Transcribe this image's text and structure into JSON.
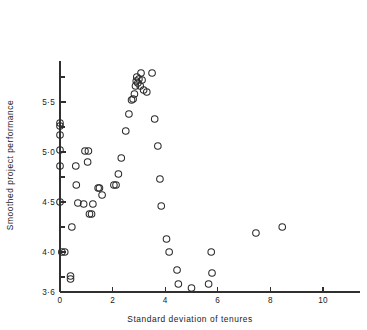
{
  "chart_data": {
    "type": "scatter",
    "title": "",
    "xlabel": "Standard deviation of tenures",
    "ylabel": "Smoothed project performance",
    "xlim": [
      0,
      11.4
    ],
    "ylim": [
      3.6,
      5.87
    ],
    "grid": false,
    "legend": null,
    "xticks": [
      0,
      2,
      4,
      6,
      8,
      10
    ],
    "xticklabels": [
      "0",
      "2",
      "4",
      "6",
      "8",
      "10"
    ],
    "yticks": [
      3.6,
      3.75,
      4.0,
      4.25,
      4.5,
      4.75,
      5.0,
      5.25,
      5.5,
      5.75
    ],
    "yticklabels_major": {
      "3.6": "3·6",
      "4.0": "4·0",
      "4.5": "4·5",
      "5.0": "5·0",
      "5.5": "5·5"
    },
    "marker": "open-circle",
    "marker_size": 4.6,
    "n_points": 58,
    "points": [
      {
        "x": 0.0,
        "y": 5.29
      },
      {
        "x": 0.0,
        "y": 5.26
      },
      {
        "x": 0.0,
        "y": 5.17
      },
      {
        "x": 0.0,
        "y": 5.02
      },
      {
        "x": 0.0,
        "y": 4.86
      },
      {
        "x": 0.0,
        "y": 4.5
      },
      {
        "x": 0.45,
        "y": 4.25
      },
      {
        "x": 0.07,
        "y": 4.0
      },
      {
        "x": 0.18,
        "y": 4.0
      },
      {
        "x": 0.4,
        "y": 3.76
      },
      {
        "x": 0.4,
        "y": 3.73
      },
      {
        "x": 0.6,
        "y": 4.86
      },
      {
        "x": 0.62,
        "y": 4.67
      },
      {
        "x": 0.68,
        "y": 4.49
      },
      {
        "x": 0.95,
        "y": 5.01
      },
      {
        "x": 1.08,
        "y": 5.01
      },
      {
        "x": 1.05,
        "y": 4.9
      },
      {
        "x": 1.12,
        "y": 4.38
      },
      {
        "x": 1.2,
        "y": 4.38
      },
      {
        "x": 1.25,
        "y": 4.48
      },
      {
        "x": 1.5,
        "y": 4.64
      },
      {
        "x": 1.6,
        "y": 4.57
      },
      {
        "x": 2.05,
        "y": 4.67
      },
      {
        "x": 2.13,
        "y": 4.67
      },
      {
        "x": 2.22,
        "y": 4.78
      },
      {
        "x": 2.33,
        "y": 4.94
      },
      {
        "x": 2.5,
        "y": 5.21
      },
      {
        "x": 2.62,
        "y": 5.38
      },
      {
        "x": 2.72,
        "y": 5.52
      },
      {
        "x": 2.78,
        "y": 5.53
      },
      {
        "x": 2.83,
        "y": 5.58
      },
      {
        "x": 2.9,
        "y": 5.71
      },
      {
        "x": 2.92,
        "y": 5.75
      },
      {
        "x": 2.96,
        "y": 5.69
      },
      {
        "x": 3.0,
        "y": 5.73
      },
      {
        "x": 3.08,
        "y": 5.79
      },
      {
        "x": 3.12,
        "y": 5.72
      },
      {
        "x": 3.18,
        "y": 5.62
      },
      {
        "x": 3.3,
        "y": 5.6
      },
      {
        "x": 3.5,
        "y": 5.79
      },
      {
        "x": 3.6,
        "y": 5.33
      },
      {
        "x": 3.72,
        "y": 5.06
      },
      {
        "x": 3.8,
        "y": 4.73
      },
      {
        "x": 3.85,
        "y": 4.46
      },
      {
        "x": 4.05,
        "y": 4.13
      },
      {
        "x": 4.15,
        "y": 4.0
      },
      {
        "x": 4.45,
        "y": 3.82
      },
      {
        "x": 4.5,
        "y": 3.68
      },
      {
        "x": 5.0,
        "y": 3.64
      },
      {
        "x": 5.65,
        "y": 3.68
      },
      {
        "x": 5.75,
        "y": 4.0
      },
      {
        "x": 5.78,
        "y": 3.79
      },
      {
        "x": 7.45,
        "y": 4.19
      },
      {
        "x": 8.45,
        "y": 4.25
      },
      {
        "x": 1.45,
        "y": 4.64
      },
      {
        "x": 0.9,
        "y": 4.48
      },
      {
        "x": 2.87,
        "y": 5.66
      },
      {
        "x": 3.05,
        "y": 5.66
      }
    ]
  },
  "axes": {
    "x_axis_label": "Standard deviation of tenures",
    "y_axis_label": "Smoothed project performance"
  }
}
